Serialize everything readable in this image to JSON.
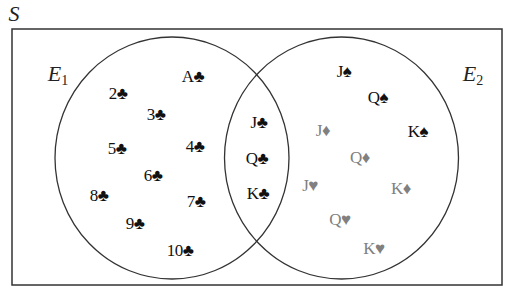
{
  "diagram": {
    "type": "venn",
    "sample_space_label": "S",
    "sets": [
      {
        "name": "E",
        "subscript": "1",
        "x": 58,
        "y": 75
      },
      {
        "name": "E",
        "subscript": "2",
        "x": 473,
        "y": 75
      }
    ],
    "colors": {
      "line": "#333333",
      "black_suit": "#111111",
      "red_suit_print": "#808080"
    },
    "regions": {
      "E1_only": [
        {
          "text": "A♣",
          "x": 193,
          "y": 76,
          "color": "black"
        },
        {
          "text": "2♣",
          "x": 118,
          "y": 93,
          "color": "black"
        },
        {
          "text": "3♣",
          "x": 156,
          "y": 114,
          "color": "black"
        },
        {
          "text": "5♣",
          "x": 117,
          "y": 148,
          "color": "black"
        },
        {
          "text": "4♣",
          "x": 195,
          "y": 146,
          "color": "black"
        },
        {
          "text": "6♣",
          "x": 153,
          "y": 175,
          "color": "black"
        },
        {
          "text": "8♣",
          "x": 99,
          "y": 195,
          "color": "black"
        },
        {
          "text": "7♣",
          "x": 196,
          "y": 201,
          "color": "black"
        },
        {
          "text": "9♣",
          "x": 135,
          "y": 223,
          "color": "black"
        },
        {
          "text": "10♣",
          "x": 180,
          "y": 250,
          "color": "black"
        }
      ],
      "E1_and_E2": [
        {
          "text": "J♣",
          "x": 259,
          "y": 122,
          "color": "black"
        },
        {
          "text": "Q♣",
          "x": 257,
          "y": 158,
          "color": "black"
        },
        {
          "text": "K♣",
          "x": 258,
          "y": 193,
          "color": "black"
        }
      ],
      "E2_only": [
        {
          "text": "J♠",
          "x": 344,
          "y": 71,
          "color": "black"
        },
        {
          "text": "Q♠",
          "x": 378,
          "y": 97,
          "color": "black"
        },
        {
          "text": "K♠",
          "x": 418,
          "y": 131,
          "color": "black"
        },
        {
          "text": "J♦",
          "x": 323,
          "y": 130,
          "color": "gray"
        },
        {
          "text": "Q♦",
          "x": 360,
          "y": 157,
          "color": "gray"
        },
        {
          "text": "K♦",
          "x": 401,
          "y": 188,
          "color": "gray"
        },
        {
          "text": "J♥",
          "x": 310,
          "y": 185,
          "color": "gray"
        },
        {
          "text": "Q♥",
          "x": 340,
          "y": 219,
          "color": "gray"
        },
        {
          "text": "K♥",
          "x": 374,
          "y": 248,
          "color": "gray"
        }
      ]
    }
  }
}
